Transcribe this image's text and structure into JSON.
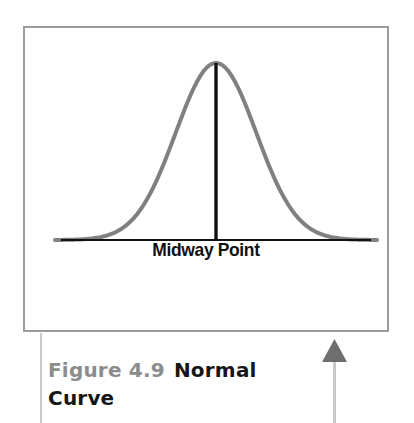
{
  "figure": {
    "panel_border_color": "#9b9b9b",
    "background_color": "#ffffff",
    "caption_number": "Figure 4.9",
    "caption_number_color": "#8c8c8c",
    "caption_title": "Normal Curve",
    "caption_title_color": "#161616",
    "axis_label": "Midway Point"
  },
  "annotations": {
    "left_connector_color": "#c9c9c9",
    "arrow_color": "#6e6e6e",
    "arrow_direction": "up"
  },
  "chart_data": {
    "type": "line",
    "title": "Normal Curve",
    "subtitle": "",
    "xlabel": "Midway Point",
    "ylabel": "",
    "grid": false,
    "legend": null,
    "axis_visible": {
      "x": true,
      "y": false
    },
    "xlim": [
      -4,
      4
    ],
    "ylim": [
      0,
      1
    ],
    "distribution": {
      "mean": 0,
      "std_dev": 1,
      "peak_height": 1
    },
    "curve_color": "#808080",
    "curve_width_px": 4,
    "baseline_color": "#111111",
    "center_line_color": "#111111",
    "x": [
      -4,
      -3.6,
      -3.2,
      -2.8,
      -2.4,
      -2,
      -1.6,
      -1.2,
      -0.8,
      -0.4,
      0,
      0.4,
      0.8,
      1.2,
      1.6,
      2,
      2.4,
      2.8,
      3.2,
      3.6,
      4
    ],
    "y": [
      0.0003,
      0.0015,
      0.006,
      0.0198,
      0.0561,
      0.1353,
      0.278,
      0.4868,
      0.7261,
      0.9231,
      1.0,
      0.9231,
      0.7261,
      0.4868,
      0.278,
      0.1353,
      0.0561,
      0.0198,
      0.006,
      0.0015,
      0.0003
    ],
    "annotations": [
      {
        "label": "Midway Point",
        "x": 0,
        "type": "vertical-line",
        "from_y": 0,
        "to_y": 1
      }
    ]
  }
}
